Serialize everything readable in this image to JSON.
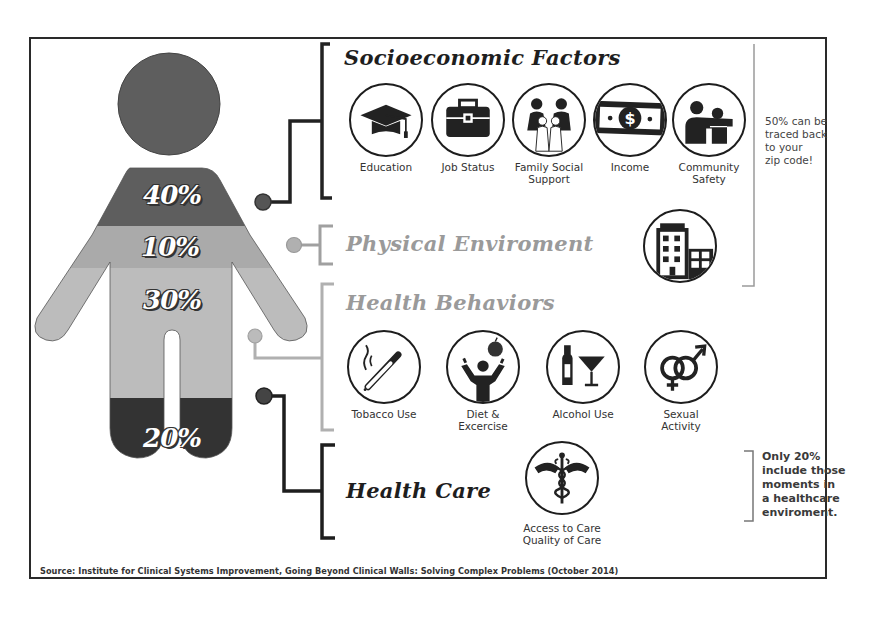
{
  "figure": {
    "segments": [
      {
        "label": "40%",
        "category": "Socioeconomic Factors",
        "color": "#5e5e5e"
      },
      {
        "label": "10%",
        "category": "Physical Environment",
        "color": "#a9a9a9"
      },
      {
        "label": "30%",
        "category": "Health Behaviors",
        "color": "#b9b9b9"
      },
      {
        "label": "20%",
        "category": "Health Care",
        "color": "#333333"
      }
    ],
    "head_color": "#5e5e5e"
  },
  "sections": {
    "socioeconomic": {
      "title": "Socioeconomic Factors",
      "icons": [
        {
          "icon": "graduation-cap-icon",
          "label": "Education"
        },
        {
          "icon": "toolbox-icon",
          "label": "Job Status"
        },
        {
          "icon": "family-icon",
          "label": "Family Social Support"
        },
        {
          "icon": "dollar-bill-icon",
          "label": "Income"
        },
        {
          "icon": "community-people-icon",
          "label": "Community Safety"
        }
      ]
    },
    "physical": {
      "title": "Physical Enviroment",
      "icons": [
        {
          "icon": "buildings-icon",
          "label": ""
        }
      ]
    },
    "behaviors": {
      "title": "Health Behaviors",
      "icons": [
        {
          "icon": "cigarette-icon",
          "label": "Tobacco Use"
        },
        {
          "icon": "apple-person-icon",
          "label": "Diet & Excercise"
        },
        {
          "icon": "bottle-glass-icon",
          "label": "Alcohol Use"
        },
        {
          "icon": "gender-symbols-icon",
          "label": "Sexual Activity"
        }
      ]
    },
    "healthcare": {
      "title": "Health Care",
      "icons": [
        {
          "icon": "caduceus-icon",
          "label_line1": "Access to Care",
          "label_line2": "Quality of Care"
        }
      ]
    }
  },
  "notes": {
    "zip_code": [
      "50% can be",
      "traced back",
      "to your",
      "zip code!"
    ],
    "healthcare": [
      "Only 20%",
      "include those",
      "moments in",
      "a healthcare",
      "enviroment."
    ]
  },
  "source": "Source: Institute for Clinical Systems Improvement, Going Beyond Clinical Walls: Solving Complex Problems (October 2014)",
  "colors": {
    "dark": "#2b2b2b",
    "mid": "#5e5e5e",
    "light": "#b5b5b5",
    "connector_light": "#a8a8a8"
  }
}
